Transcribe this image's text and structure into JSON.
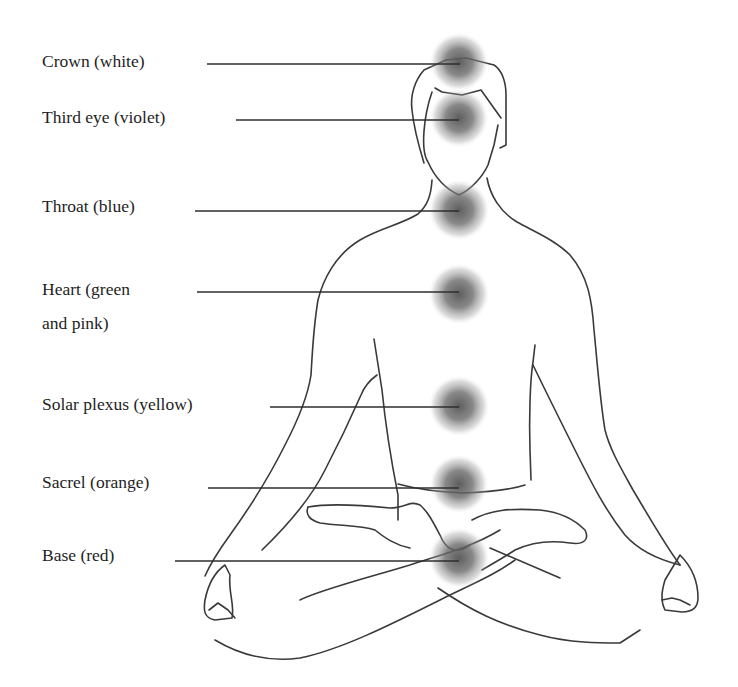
{
  "diagram": {
    "glow_color": "#555555",
    "line_color": "#333333",
    "chakras": [
      {
        "id": "crown",
        "label": "Crown (white)",
        "label_x": 42,
        "label_y": 44,
        "line_x1": 207,
        "line_y": 64,
        "cx": 459,
        "cy": 62
      },
      {
        "id": "third-eye",
        "label": "Third eye (violet)",
        "label_x": 42,
        "label_y": 100,
        "line_x1": 236,
        "line_y": 120,
        "cx": 459,
        "cy": 118
      },
      {
        "id": "throat",
        "label": "Throat (blue)",
        "label_x": 42,
        "label_y": 189,
        "line_x1": 195,
        "line_y": 211,
        "cx": 459,
        "cy": 210
      },
      {
        "id": "heart",
        "label": "Heart (green\nand pink)",
        "label_x": 42,
        "label_y": 272,
        "line_x1": 197,
        "line_y": 292,
        "cx": 459,
        "cy": 294
      },
      {
        "id": "solar-plexus",
        "label": "Solar plexus (yellow)",
        "label_x": 42,
        "label_y": 387,
        "line_x1": 270,
        "line_y": 407,
        "cx": 459,
        "cy": 406
      },
      {
        "id": "sacral",
        "label": "Sacrel (orange)",
        "label_x": 42,
        "label_y": 465,
        "line_x1": 208,
        "line_y": 488,
        "cx": 459,
        "cy": 484
      },
      {
        "id": "base",
        "label": "Base (red)",
        "label_x": 42,
        "label_y": 538,
        "line_x1": 175,
        "line_y": 561,
        "cx": 459,
        "cy": 558
      }
    ]
  }
}
